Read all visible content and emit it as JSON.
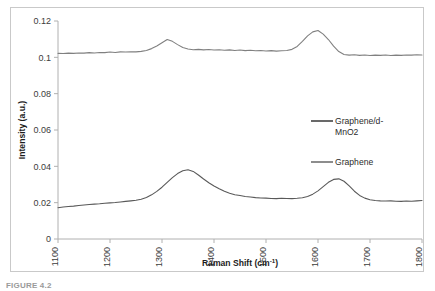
{
  "figure": {
    "caption_fragment": "FIGURE 4.2"
  },
  "chart_data": {
    "type": "line",
    "title": "",
    "xlabel": "Raman Shift (cm-1)",
    "xlabel_base": "Raman Shift (cm",
    "xlabel_sup": "-1",
    "xlabel_close": ")",
    "ylabel": "Intensity (a.u.)",
    "xlim": [
      1100,
      1800
    ],
    "ylim": [
      0,
      0.12
    ],
    "xticks": [
      1100,
      1200,
      1300,
      1400,
      1500,
      1600,
      1700,
      1800
    ],
    "xtick_labels": [
      "1100",
      "1200",
      "1300",
      "1400",
      "1500",
      "1600",
      "1700",
      "1800"
    ],
    "yticks": [
      0,
      0.02,
      0.04,
      0.06,
      0.08,
      0.1,
      0.12
    ],
    "ytick_labels": [
      "0",
      "0.02",
      "0.04",
      "0.06",
      "0.08",
      "0.1",
      "0.12"
    ],
    "grid": false,
    "legend_position": "center-right",
    "colors": {
      "graphene_mno2": "#595959",
      "graphene": "#808080",
      "axis": "#b0b0b0",
      "frame": "#c9c9c9"
    },
    "series": [
      {
        "name": "Graphene/d-MnO2",
        "label_line1": "Graphene/d-",
        "label_line2": "MnO2",
        "color": "#595959",
        "peaks": [
          {
            "x": 1300,
            "y": 0.038,
            "note": "D band"
          },
          {
            "x": 1600,
            "y": 0.033,
            "note": "G band"
          }
        ],
        "x": [
          1100,
          1110,
          1120,
          1130,
          1140,
          1150,
          1160,
          1170,
          1180,
          1190,
          1200,
          1210,
          1220,
          1230,
          1240,
          1250,
          1260,
          1270,
          1280,
          1290,
          1300,
          1310,
          1320,
          1330,
          1340,
          1350,
          1360,
          1370,
          1380,
          1390,
          1400,
          1410,
          1420,
          1430,
          1440,
          1450,
          1460,
          1470,
          1480,
          1490,
          1500,
          1510,
          1520,
          1530,
          1540,
          1550,
          1560,
          1570,
          1580,
          1590,
          1600,
          1610,
          1620,
          1630,
          1640,
          1650,
          1660,
          1670,
          1680,
          1690,
          1700,
          1710,
          1720,
          1730,
          1740,
          1750,
          1760,
          1770,
          1780,
          1790,
          1800
        ],
        "y": [
          0.0172,
          0.0176,
          0.0179,
          0.0181,
          0.0184,
          0.0187,
          0.019,
          0.0192,
          0.0194,
          0.0197,
          0.0199,
          0.0201,
          0.0204,
          0.0207,
          0.021,
          0.0213,
          0.0219,
          0.0228,
          0.0243,
          0.0262,
          0.0285,
          0.0312,
          0.0338,
          0.036,
          0.0376,
          0.0381,
          0.0372,
          0.0352,
          0.033,
          0.031,
          0.0292,
          0.0277,
          0.0263,
          0.0252,
          0.0244,
          0.0239,
          0.0234,
          0.0231,
          0.0228,
          0.0226,
          0.0225,
          0.0223,
          0.0222,
          0.0224,
          0.0223,
          0.0222,
          0.0224,
          0.0227,
          0.0234,
          0.0247,
          0.0265,
          0.0288,
          0.0312,
          0.0328,
          0.0331,
          0.0318,
          0.0292,
          0.0263,
          0.024,
          0.0225,
          0.0216,
          0.0212,
          0.021,
          0.0209,
          0.021,
          0.0208,
          0.0207,
          0.0209,
          0.0208,
          0.021,
          0.0212
        ]
      },
      {
        "name": "Graphene",
        "label_line1": "Graphene",
        "color": "#808080",
        "peaks": [
          {
            "x": 1300,
            "y": 0.11,
            "note": "D band"
          },
          {
            "x": 1600,
            "y": 0.115,
            "note": "G band"
          }
        ],
        "x": [
          1100,
          1110,
          1120,
          1130,
          1140,
          1150,
          1160,
          1170,
          1180,
          1190,
          1200,
          1210,
          1220,
          1230,
          1240,
          1250,
          1260,
          1270,
          1280,
          1290,
          1300,
          1310,
          1320,
          1330,
          1340,
          1350,
          1360,
          1370,
          1380,
          1390,
          1400,
          1410,
          1420,
          1430,
          1440,
          1450,
          1460,
          1470,
          1480,
          1490,
          1500,
          1510,
          1520,
          1530,
          1540,
          1550,
          1560,
          1570,
          1580,
          1590,
          1600,
          1610,
          1620,
          1630,
          1640,
          1650,
          1660,
          1670,
          1680,
          1690,
          1700,
          1710,
          1720,
          1730,
          1740,
          1750,
          1760,
          1770,
          1780,
          1790,
          1800
        ],
        "y": [
          0.1022,
          0.1021,
          0.1023,
          0.1022,
          0.1024,
          0.1023,
          0.1026,
          0.1024,
          0.1027,
          0.1026,
          0.1029,
          0.1027,
          0.103,
          0.1029,
          0.1031,
          0.103,
          0.1033,
          0.1038,
          0.1048,
          0.1062,
          0.108,
          0.1098,
          0.1088,
          0.107,
          0.1054,
          0.1046,
          0.1042,
          0.1044,
          0.1041,
          0.1043,
          0.104,
          0.1042,
          0.1039,
          0.1041,
          0.1038,
          0.104,
          0.1037,
          0.1039,
          0.1036,
          0.1038,
          0.1035,
          0.1037,
          0.1034,
          0.1036,
          0.1038,
          0.1044,
          0.106,
          0.1088,
          0.1118,
          0.114,
          0.1148,
          0.1128,
          0.1098,
          0.1062,
          0.1032,
          0.1016,
          0.1012,
          0.1014,
          0.1011,
          0.1013,
          0.101,
          0.1012,
          0.1011,
          0.1013,
          0.101,
          0.1012,
          0.1011,
          0.1013,
          0.1012,
          0.1014,
          0.1013
        ]
      }
    ]
  }
}
